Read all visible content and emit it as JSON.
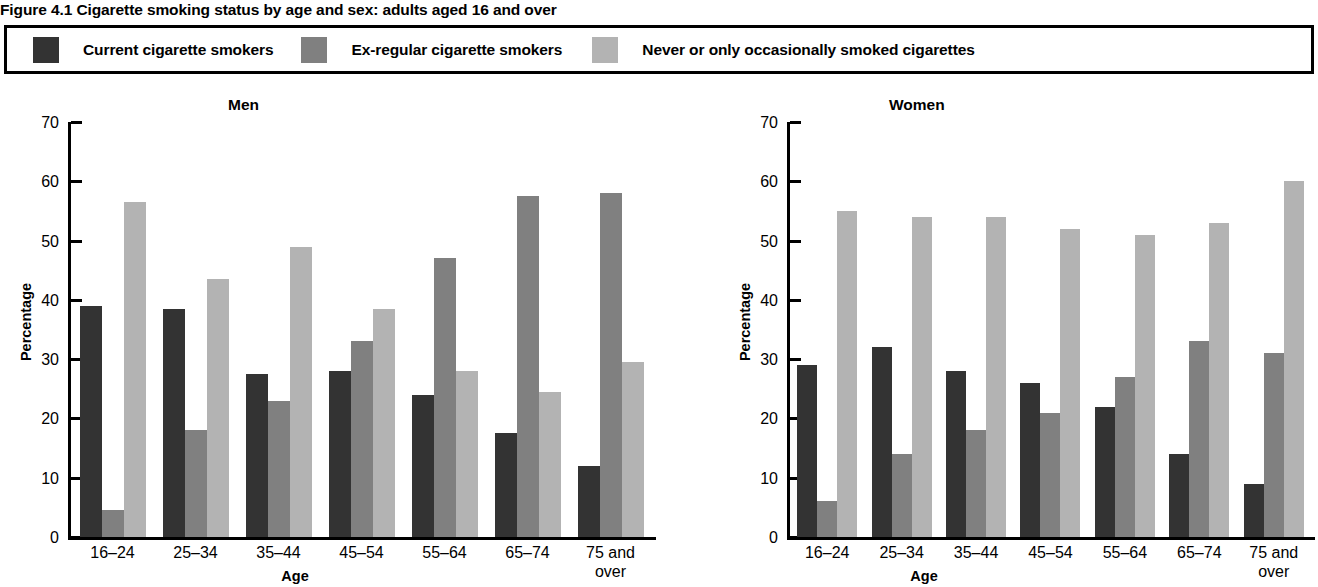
{
  "figure": {
    "title": "Figure 4.1 Cigarette smoking status by age and sex: adults aged 16 and over"
  },
  "legend": {
    "items": [
      {
        "label": "Current cigarette smokers",
        "color": "#333333",
        "swatch_name": "legend-swatch-current"
      },
      {
        "label": "Ex-regular cigarette smokers",
        "color": "#808080",
        "swatch_name": "legend-swatch-ex-regular"
      },
      {
        "label": "Never or only occasionally smoked cigarettes",
        "color": "#b3b3b3",
        "swatch_name": "legend-swatch-never"
      }
    ]
  },
  "colors": {
    "current": "#333333",
    "ex_regular": "#808080",
    "never": "#b3b3b3",
    "axis": "#000000",
    "background": "#ffffff"
  },
  "axes": {
    "ylabel": "Percentage",
    "xlabel": "Age",
    "yticks": [
      0,
      10,
      20,
      30,
      40,
      50,
      60,
      70
    ],
    "ylim": [
      0,
      70
    ],
    "categories": [
      "16–24",
      "25–34",
      "35–44",
      "45–54",
      "55–64",
      "65–74",
      "75 and over"
    ]
  },
  "panels": [
    {
      "title": "Men"
    },
    {
      "title": "Women"
    }
  ],
  "chart_data": [
    {
      "type": "bar",
      "title": "Men",
      "xlabel": "Age",
      "ylabel": "Percentage",
      "ylim": [
        0,
        70
      ],
      "yticks": [
        0,
        10,
        20,
        30,
        40,
        50,
        60,
        70
      ],
      "grid": false,
      "legend_position": "top",
      "categories": [
        "16–24",
        "25–34",
        "35–44",
        "45–54",
        "55–64",
        "65–74",
        "75 and over"
      ],
      "series": [
        {
          "name": "Current cigarette smokers",
          "color": "#333333",
          "values": [
            39,
            38.5,
            27.5,
            28,
            24,
            17.5,
            12
          ]
        },
        {
          "name": "Ex-regular cigarette smokers",
          "color": "#808080",
          "values": [
            4.5,
            18,
            23,
            33,
            47,
            57.5,
            58
          ]
        },
        {
          "name": "Never or only occasionally smoked cigarettes",
          "color": "#b3b3b3",
          "values": [
            56.5,
            43.5,
            49,
            38.5,
            28,
            24.5,
            29.5
          ]
        }
      ]
    },
    {
      "type": "bar",
      "title": "Women",
      "xlabel": "Age",
      "ylabel": "Percentage",
      "ylim": [
        0,
        70
      ],
      "yticks": [
        0,
        10,
        20,
        30,
        40,
        50,
        60,
        70
      ],
      "grid": false,
      "legend_position": "top",
      "categories": [
        "16–24",
        "25–34",
        "35–44",
        "45–54",
        "55–64",
        "65–74",
        "75 and over"
      ],
      "series": [
        {
          "name": "Current cigarette smokers",
          "color": "#333333",
          "values": [
            29,
            32,
            28,
            26,
            22,
            14,
            9
          ]
        },
        {
          "name": "Ex-regular cigarette smokers",
          "color": "#808080",
          "values": [
            6,
            14,
            18,
            21,
            27,
            33,
            31
          ]
        },
        {
          "name": "Never or only occasionally smoked cigarettes",
          "color": "#b3b3b3",
          "values": [
            55,
            54,
            54,
            52,
            51,
            53,
            60
          ]
        }
      ]
    }
  ]
}
